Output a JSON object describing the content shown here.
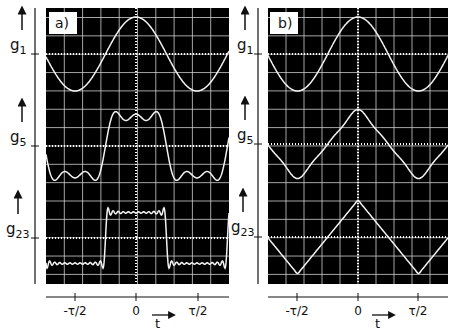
{
  "figure": {
    "background": "#ffffff",
    "screen_color": "#000000",
    "trace_color": "#f2f2f2",
    "grid_color": "#d8d8d8",
    "ink_color": "#111111"
  },
  "panels": [
    {
      "id": "a",
      "label": "a)",
      "traces": [
        {
          "name": "g1",
          "label_main": "g",
          "label_sub": "1",
          "waveform": "square",
          "harmonics": 1
        },
        {
          "name": "g5",
          "label_main": "g",
          "label_sub": "5",
          "waveform": "square",
          "harmonics": 5
        },
        {
          "name": "g23",
          "label_main": "g",
          "label_sub": "23",
          "waveform": "square",
          "harmonics": 23
        }
      ],
      "time_axis": {
        "ticks": [
          "-τ/2",
          "0",
          "τ/2"
        ],
        "label": "t"
      }
    },
    {
      "id": "b",
      "label": "b)",
      "traces": [
        {
          "name": "g1",
          "label_main": "g",
          "label_sub": "1",
          "waveform": "triangle",
          "harmonics": 1
        },
        {
          "name": "g5",
          "label_main": "g",
          "label_sub": "5",
          "waveform": "triangle",
          "harmonics": 5
        },
        {
          "name": "g23",
          "label_main": "g",
          "label_sub": "23",
          "waveform": "triangle",
          "harmonics": 23
        }
      ],
      "time_axis": {
        "ticks": [
          "-τ/2",
          "0",
          "τ/2"
        ],
        "label": "t"
      }
    }
  ],
  "chart_data": [
    {
      "type": "line",
      "title": "a)",
      "subtitle": "Fourier synthesis of a square wave (partial sums g1, g5, g23)",
      "xlabel": "t",
      "ylabel": "",
      "x_ticks": [
        "-τ/2",
        "0",
        "τ/2"
      ],
      "xlim": [
        "-0.75τ",
        "0.75τ"
      ],
      "grid": true,
      "series": [
        {
          "name": "g1",
          "description": "fundamental cosine, peak at t=0, troughs at ±τ/2",
          "amplitude_div": 2.0
        },
        {
          "name": "g5",
          "description": "partial sum up to 5th harmonic, rippled plateau (3 bumps) around t=0",
          "amplitude_div": 1.85
        },
        {
          "name": "g23",
          "description": "partial sum up to 23rd harmonic, near-rectangular pulse high for |t|<τ/4 with Gibbs overshoot",
          "amplitude_div": 1.6
        }
      ]
    },
    {
      "type": "line",
      "title": "b)",
      "subtitle": "Fourier synthesis of a triangle wave (partial sums g1, g5, g23)",
      "xlabel": "t",
      "ylabel": "",
      "x_ticks": [
        "-τ/2",
        "0",
        "τ/2"
      ],
      "xlim": [
        "-0.75τ",
        "0.75τ"
      ],
      "grid": true,
      "series": [
        {
          "name": "g1",
          "description": "fundamental cosine, peak at t=0, troughs at ±τ/2",
          "amplitude_div": 2.0
        },
        {
          "name": "g5",
          "description": "near-triangular wave, slightly rounded peaks",
          "amplitude_div": 2.0
        },
        {
          "name": "g23",
          "description": "sharp triangle wave, peak at t=0, troughs at ±τ/2",
          "amplitude_div": 2.0
        }
      ]
    }
  ]
}
